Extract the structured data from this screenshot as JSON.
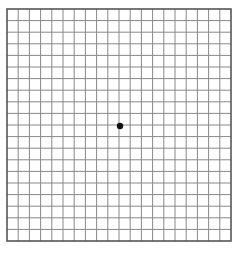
{
  "figure": {
    "type": "amsler-grid",
    "rows": 20,
    "columns": 20,
    "grid_box": {
      "x": 7,
      "y": 9,
      "width": 224,
      "height": 232
    },
    "line_color": "#888888",
    "border_color": "#555555",
    "background": "#ffffff",
    "center_dot": {
      "x": 120,
      "y": 126,
      "radius": 3.2,
      "color": "#111111"
    }
  }
}
